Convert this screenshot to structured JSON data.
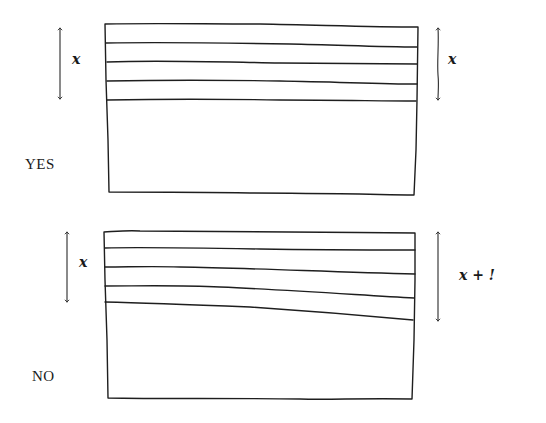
{
  "panels": [
    {
      "id": "yes",
      "verdict": "YES",
      "left_label": "x",
      "right_label": "x",
      "layer_count": 4
    },
    {
      "id": "no",
      "verdict": "NO",
      "left_label": "x",
      "right_label": "x + !",
      "layer_count": 4
    }
  ],
  "colors": {
    "ink": "#1e1e1e",
    "background": "#ffffff"
  }
}
